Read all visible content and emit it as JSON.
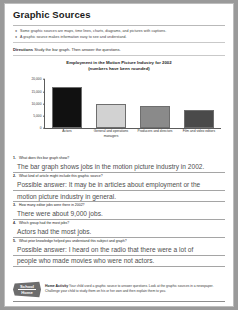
{
  "page": {
    "title": "Graphic Sources",
    "bullets": [
      "Some graphic sources are maps, time lines, charts, diagrams, and pictures with captions.",
      "A graphic source makes information easy to see and understand."
    ],
    "directions_label": "Directions",
    "directions_text": "Study the bar graph. Then answer the questions."
  },
  "chart_data": {
    "type": "bar",
    "title": "Employment in the Motion Picture Industry for 2002",
    "subtitle": "(numbers have been rounded)",
    "categories": [
      "Actors",
      "General and operations managers",
      "Producers and directors",
      "Film and video editors"
    ],
    "values": [
      17000,
      10000,
      9000,
      7500
    ],
    "bar_colors": [
      "#111111",
      "#d2d2d2",
      "#8a8a8a",
      "#4a4a4a"
    ],
    "xlabel": "",
    "ylabel": "",
    "ylim": [
      0,
      20000
    ],
    "yticks": [
      20000,
      15000,
      10000,
      5000,
      0
    ],
    "ytick_labels": [
      "20,000",
      "15,000",
      "10,000",
      "5,000",
      "0"
    ],
    "grid": false,
    "legend": "none"
  },
  "questions": [
    {
      "number": "1.",
      "prompt": "What does this bar graph show?",
      "answer": "The bar graph shows jobs in the motion picture industry in 2002.",
      "answer_lines": [
        "The bar graph shows jobs in the motion picture industry in 2002."
      ]
    },
    {
      "number": "2.",
      "prompt": "What kind of article might include this graphic source?",
      "answer": "Possible answer: It may be in articles about employment or the motion picture industry in general.",
      "answer_lines": [
        "Possible answer: It may be in articles about employment or the",
        "motion picture industry in general."
      ]
    },
    {
      "number": "3.",
      "prompt": "How many editor jobs were there in 2002?",
      "answer": "There were about 9,000 jobs.",
      "answer_lines": [
        "There were about 9,000 jobs."
      ]
    },
    {
      "number": "4.",
      "prompt": "Which group had the most jobs?",
      "answer": "Actors had the most jobs.",
      "answer_lines": [
        "Actors had the most jobs."
      ]
    },
    {
      "number": "5.",
      "prompt": "What prior knowledge helped you understand this subject and graph?",
      "answer": "Possible answer: I heard on the radio that there were a lot of people who made movies who were not actors.",
      "answer_lines": [
        "Possible answer: I heard on the radio that there were a lot of",
        "people who made movies who were not actors."
      ]
    }
  ],
  "footer": {
    "logo_line1": "School",
    "logo_line2": "Home",
    "label": "Home Activity",
    "text": "Your child used a graphic source to answer questions. Look at the graphic sources in a newspaper. Challenge your child to study them on his or her own and then explain them to you."
  }
}
